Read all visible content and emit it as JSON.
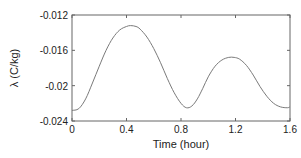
{
  "chart_data": {
    "type": "line",
    "title": "",
    "xlabel": "Time (hour)",
    "ylabel": "λ (C/kg)",
    "xlim": [
      0,
      1.6
    ],
    "ylim": [
      -0.024,
      -0.012
    ],
    "xticks": [
      0,
      0.4,
      0.8,
      1.2,
      1.6
    ],
    "xtick_labels": [
      "0",
      "0.4",
      "0.8",
      "1.2",
      "1.6"
    ],
    "yticks": [
      -0.012,
      -0.016,
      -0.02,
      -0.024
    ],
    "ytick_labels": [
      "-0.012",
      "-0.016",
      "-0.02",
      "-0.024"
    ],
    "grid": false,
    "legend": null,
    "line_color": "#7a7a7a",
    "series": [
      {
        "name": "lambda",
        "x": [
          0.0,
          0.05,
          0.1,
          0.15,
          0.2,
          0.25,
          0.3,
          0.35,
          0.4,
          0.43,
          0.47,
          0.5,
          0.55,
          0.6,
          0.65,
          0.7,
          0.75,
          0.8,
          0.84,
          0.88,
          0.92,
          0.96,
          1.0,
          1.05,
          1.1,
          1.15,
          1.19,
          1.23,
          1.28,
          1.33,
          1.38,
          1.43,
          1.48,
          1.53,
          1.58,
          1.6
        ],
        "y": [
          -0.0228,
          -0.0226,
          -0.0215,
          -0.0197,
          -0.0178,
          -0.016,
          -0.0146,
          -0.0137,
          -0.0133,
          -0.0132,
          -0.0133,
          -0.0136,
          -0.0145,
          -0.0158,
          -0.0174,
          -0.0192,
          -0.0208,
          -0.022,
          -0.0225,
          -0.0223,
          -0.0215,
          -0.0203,
          -0.019,
          -0.0178,
          -0.0171,
          -0.0168,
          -0.0168,
          -0.017,
          -0.0177,
          -0.0188,
          -0.0201,
          -0.0212,
          -0.022,
          -0.0224,
          -0.0225,
          -0.0224
        ]
      }
    ]
  }
}
